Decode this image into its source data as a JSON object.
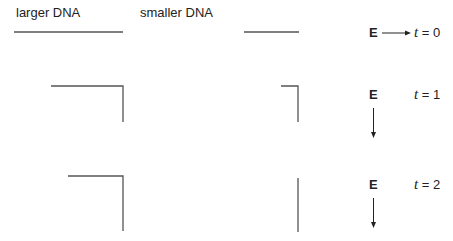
{
  "headers": {
    "larger": "larger DNA",
    "smaller": "smaller DNA"
  },
  "enzyme_label": "E",
  "rows": [
    {
      "time_var": "t",
      "time_eq": " = 0",
      "enzyme_state": "moving-right",
      "larger_dna": "straight",
      "smaller_dna": "straight"
    },
    {
      "time_var": "t",
      "time_eq": " = 1",
      "enzyme_state": "moving-down",
      "larger_dna": "bent",
      "smaller_dna": "bent"
    },
    {
      "time_var": "t",
      "time_eq": " = 2",
      "enzyme_state": "moving-down",
      "larger_dna": "bent",
      "smaller_dna": "vertical"
    }
  ]
}
